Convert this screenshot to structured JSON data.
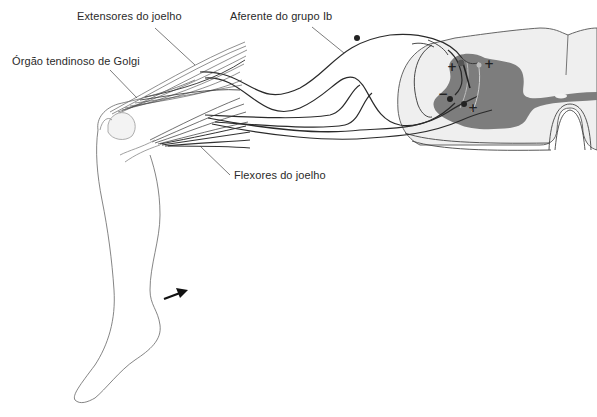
{
  "diagram": {
    "type": "anatomical-reflex-diagram",
    "labels": {
      "extensors": "Extensores do joelho",
      "golgi": "Órgão tendinoso de Golgi",
      "afferent": "Aferente do grupo Ib",
      "flexors": "Flexores do joelho"
    },
    "synapse_signs": {
      "excitatory_interneuron": "+",
      "excitatory_motor": "+",
      "inhibitory": "−",
      "excitatory_flexor": "+"
    },
    "colors": {
      "gray_matter": "#7d7d7d",
      "white_matter": "#efefef",
      "line": "#2a2a2a",
      "muscle": "#444444"
    },
    "arrow": "movement-direction-arrow"
  }
}
